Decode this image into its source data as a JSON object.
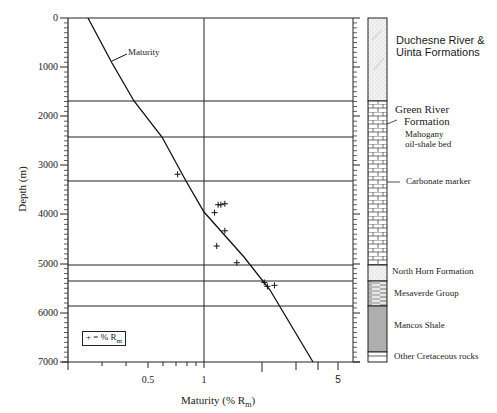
{
  "chart_data": {
    "type": "scatter",
    "title": "",
    "xlabel": "Maturity (% Rm)",
    "ylabel": "Depth (m)",
    "x_scale": "log",
    "xlim": [
      0.2,
      6
    ],
    "ylim": [
      7000,
      0
    ],
    "x_ticks": [
      {
        "value": 0.5,
        "label": "0.5"
      },
      {
        "value": 1,
        "label": "1"
      },
      {
        "value": 5,
        "label": "5"
      }
    ],
    "y_ticks": [
      0,
      1000,
      2000,
      3000,
      4000,
      5000,
      6000,
      7000
    ],
    "y_tick_labels": [
      "0",
      "1000",
      "2000",
      "3000",
      "4000",
      "5000",
      "6000",
      "7000"
    ],
    "grid": {
      "vertical_at_x": [
        1
      ],
      "horizontal_at_depth": [
        1700,
        2430,
        3320,
        5030,
        5350,
        5860
      ]
    },
    "series": [
      {
        "name": "Maturity",
        "kind": "line",
        "points": [
          [
            0.26,
            0
          ],
          [
            0.33,
            800
          ],
          [
            0.42,
            1700
          ],
          [
            0.55,
            2430
          ],
          [
            0.75,
            3320
          ],
          [
            1.0,
            3900
          ],
          [
            1.6,
            4900
          ],
          [
            2.2,
            5500
          ],
          [
            3.7,
            7000
          ]
        ]
      },
      {
        "name": "% Rm",
        "kind": "markers",
        "marker": "+",
        "points": [
          [
            0.74,
            3180
          ],
          [
            1.2,
            3800
          ],
          [
            1.24,
            3800
          ],
          [
            1.3,
            3780
          ],
          [
            1.15,
            3960
          ],
          [
            1.3,
            4330
          ],
          [
            1.18,
            4640
          ],
          [
            1.5,
            4980
          ],
          [
            2.08,
            5380
          ],
          [
            2.16,
            5460
          ],
          [
            2.35,
            5440
          ]
        ]
      }
    ],
    "annotations": [
      {
        "text": "Maturity",
        "at": [
          0.35,
          750
        ]
      }
    ],
    "legend": {
      "text": "+ = % Rm",
      "position": "lower-left"
    },
    "stratigraphic_column": [
      {
        "name": "Duchesne River & Uinta Formations",
        "top": 0,
        "base": 1700,
        "pattern": "sandstone-stipple"
      },
      {
        "name": "Green River Formation",
        "top": 1700,
        "base": 5030,
        "pattern": "limestone-brick",
        "sublabels": [
          "Mahogany oil-shale bed",
          "Carbonate marker"
        ]
      },
      {
        "name": "North Horn Formation",
        "top": 5030,
        "base": 5350,
        "pattern": "stipple"
      },
      {
        "name": "Mesaverde Group",
        "top": 5350,
        "base": 5860,
        "pattern": "interbedded"
      },
      {
        "name": "Mancos Shale",
        "top": 5860,
        "base": 6800,
        "pattern": "shale"
      },
      {
        "name": "Other Cretaceous rocks",
        "top": 6800,
        "base": 7000,
        "pattern": "lines"
      }
    ]
  },
  "axes": {
    "ylabel": "Depth (m)",
    "xlabel_main": "Maturity (% R",
    "xlabel_sub": "m",
    "xlabel_close": ")",
    "yticks": [
      "0",
      "1000",
      "2000",
      "3000",
      "4000",
      "5000",
      "6000",
      "7000"
    ],
    "xticks": [
      "0.5",
      "1",
      "5"
    ]
  },
  "labels": {
    "maturity_curve": "Maturity",
    "legend_main": "+ = % R",
    "legend_sub": "m",
    "duchesne_1": "Duchesne River &",
    "duchesne_2": "Uinta Formations",
    "green_river_1": "Green River",
    "green_river_2": "Formation",
    "mahogany_1": "Mahogany",
    "mahogany_2": "oil-shale bed",
    "carbonate": "Carbonate marker",
    "north_horn": "North Horn Formation",
    "mesaverde": "Mesaverde Group",
    "mancos": "Mancos Shale",
    "other_cretaceous": "Other Cretaceous rocks"
  }
}
